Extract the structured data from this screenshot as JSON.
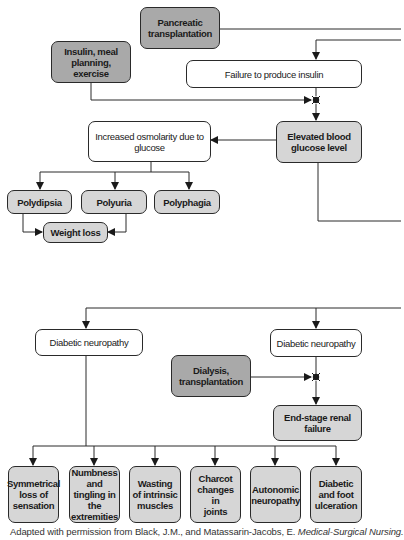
{
  "colors": {
    "treatment_fill": "#a9a9a9",
    "condition_fill": "#d6d6d6",
    "process_fill": "#ffffff",
    "line": "#2a2a2a"
  },
  "nodes": {
    "pancreatic_transplantation": "Pancreatic\ntransplantation",
    "insulin_meal_planning": "Insulin, meal\nplanning, exercise",
    "failure_to_produce_insulin": "Failure to produce insulin",
    "elevated_blood_glucose": "Elevated blood\nglucose level",
    "increased_osmolarity": "Increased osmolarity due to\nglucose",
    "polydipsia": "Polydipsia",
    "polyuria": "Polyuria",
    "polyphagia": "Polyphagia",
    "weight_loss": "Weight loss",
    "diabetic_neuropathy_left": "Diabetic neuropathy",
    "diabetic_neuropathy_right": "Diabetic neuropathy",
    "dialysis_transplantation": "Dialysis,\ntransplantation",
    "end_stage_renal_failure": "End-stage renal\nfailure",
    "outcomes": [
      "Symmetrical\nloss of\nsensation",
      "Numbness\nand tingling in\nthe\nextremities",
      "Wasting\nof intrinsic\nmuscles",
      "Charcot\nchanges in\njoints",
      "Autonomic\nneuropathy",
      "Diabetic\nand foot\nulceration"
    ]
  },
  "caption": {
    "prefix": "Adapted with permission from Black, J.M., and Matassarin-Jacobs, E. ",
    "title": "Medical-Surgical Nursing."
  }
}
